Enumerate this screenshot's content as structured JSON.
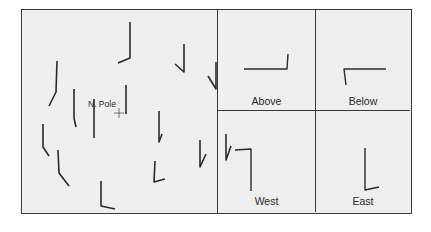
{
  "figure": {
    "main_panel": {
      "pole_label": "N. Pole",
      "stroke_color": "#2b2b2b",
      "strokes": [
        {
          "points": [
            [
              108,
              12
            ],
            [
              108,
              48
            ],
            [
              96,
              53
            ]
          ]
        },
        {
          "points": [
            [
              35,
              51
            ],
            [
              34,
              82
            ],
            [
              27,
              96
            ]
          ]
        },
        {
          "points": [
            [
              162,
              34
            ],
            [
              162,
              62
            ],
            [
              153,
              54
            ]
          ]
        },
        {
          "points": [
            [
              194,
              52
            ],
            [
              194,
              79
            ],
            [
              186,
              66
            ]
          ]
        },
        {
          "points": [
            [
              104,
              75
            ],
            [
              104,
              104
            ]
          ]
        },
        {
          "points": [
            [
              52,
              79
            ],
            [
              52,
              108
            ],
            [
              54,
              117
            ]
          ]
        },
        {
          "points": [
            [
              72,
              89
            ],
            [
              72,
              128
            ]
          ]
        },
        {
          "points": [
            [
              137,
              101
            ],
            [
              137,
              132
            ],
            [
              140,
              124
            ]
          ]
        },
        {
          "points": [
            [
              21,
              114
            ],
            [
              21,
              137
            ],
            [
              27,
              146
            ]
          ]
        },
        {
          "points": [
            [
              36,
              140
            ],
            [
              37,
              163
            ],
            [
              47,
              176
            ]
          ]
        },
        {
          "points": [
            [
              178,
              130
            ],
            [
              178,
              157
            ],
            [
              184,
              144
            ]
          ]
        },
        {
          "points": [
            [
              204,
              124
            ],
            [
              204,
              150
            ],
            [
              209,
              136
            ]
          ]
        },
        {
          "points": [
            [
              133,
              151
            ],
            [
              132,
              172
            ],
            [
              143,
              169
            ]
          ]
        },
        {
          "points": [
            [
              79,
              171
            ],
            [
              79,
              196
            ],
            [
              93,
              199
            ]
          ]
        }
      ],
      "pole_marker": {
        "x": 97,
        "y": 103
      }
    },
    "subpanels": [
      {
        "id": "above",
        "label": "Above",
        "shape": [
          [
            26,
            59
          ],
          [
            69,
            59
          ],
          [
            70,
            44
          ]
        ]
      },
      {
        "id": "below",
        "label": "Below",
        "shape": [
          [
            70,
            59
          ],
          [
            28,
            59
          ],
          [
            30,
            75
          ]
        ]
      },
      {
        "id": "west",
        "label": "West",
        "shape": [
          [
            17,
            39
          ],
          [
            33,
            38
          ],
          [
            33,
            80
          ]
        ]
      },
      {
        "id": "east",
        "label": "East",
        "shape": [
          [
            49,
            37
          ],
          [
            49,
            79
          ],
          [
            63,
            76
          ]
        ]
      }
    ]
  }
}
